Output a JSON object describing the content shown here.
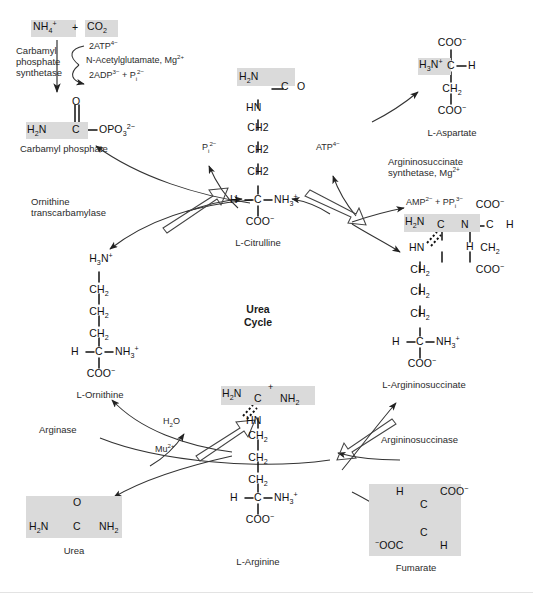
{
  "diagram": {
    "center_label_line1": "Urea",
    "center_label_line2": "Cycle"
  },
  "substrates": {
    "ammonia_co2": "NH4+ + CO2",
    "ammonia": "NH",
    "ammonia_sub": "4",
    "ammonia_sup": "+",
    "plus": "+",
    "co2": "CO",
    "co2_sub": "2"
  },
  "enzymes": [
    {
      "name": "carbamyl-phosphate-synthetase",
      "lines": [
        "Carbamyl",
        "phosphate",
        "synthetase"
      ]
    },
    {
      "name": "ornithine-transcarbamylase",
      "lines": [
        "Ornithine",
        "transcarbamylase"
      ]
    },
    {
      "name": "argininosuccinate-synthetase",
      "lines": [
        "Argininosuccinate",
        "synthetase, Mg2+"
      ]
    },
    {
      "name": "argininosuccinase",
      "lines": [
        "Argininosuccinase"
      ]
    },
    {
      "name": "arginase",
      "lines": [
        "Arginase"
      ]
    }
  ],
  "cofactors": {
    "atp2": "2ATP4-",
    "nag": "N-Acetylglutamate, Mg2+",
    "adp2": "2ADP3- + Pi2-",
    "pi": "Pi2-",
    "atp": "ATP4-",
    "amp_ppi": "AMP2- + PPi3-",
    "water": "H2O",
    "manganese": "Mu2+"
  },
  "metabolites": [
    {
      "id": "carbamyl-phosphate",
      "label": "Carbamyl phosphate"
    },
    {
      "id": "l-citrulline",
      "label": "L-Citrulline"
    },
    {
      "id": "l-aspartate",
      "label": "L-Aspartate"
    },
    {
      "id": "l-argininosuccinate",
      "label": "L-Argininosuccinate"
    },
    {
      "id": "l-arginine",
      "label": "L-Arginine"
    },
    {
      "id": "fumarate",
      "label": "Fumarate"
    },
    {
      "id": "l-ornithine",
      "label": "L-Ornithine"
    },
    {
      "id": "urea",
      "label": "Urea"
    }
  ],
  "structures": {
    "carbamyl_phosphate": {
      "name": "carbamyl-phosphate-structure",
      "o_top": "O",
      "left": "H2N",
      "center": "C",
      "right": "OPO3 2-"
    },
    "citrulline": {
      "name": "l-citrulline-structure",
      "h2n": "H2N",
      "co": "C=O",
      "hn": "HN",
      "ch2_a": "CH2",
      "ch2_b": "CH2",
      "ch2_c": "CH2",
      "h": "H",
      "c": "C",
      "nh3": "NH3+",
      "coo": "COO-"
    },
    "aspartate": {
      "name": "l-aspartate-structure",
      "coo_top": "COO-",
      "h3n": "H3N+",
      "c": "C",
      "h": "H",
      "ch2": "CH2",
      "coo_bottom": "COO-"
    },
    "argininosuccinate": {
      "name": "l-argininosuccinate-structure",
      "h2n": "H2N",
      "c": "C",
      "n": "N",
      "h_n": "H",
      "hn": "HN",
      "coo_top": "COO-",
      "c_side": "C",
      "h_side": "H",
      "ch2_side": "CH2",
      "coo_side": "COO-",
      "ch2_a": "CH2",
      "ch2_b": "CH2",
      "ch2_c": "CH2",
      "h": "H",
      "c_alpha": "C",
      "nh3": "NH3+",
      "coo": "COO-"
    },
    "arginine": {
      "name": "l-arginine-structure",
      "h2n": "H2N",
      "plus": "+",
      "c": "C",
      "nh2": "NH2",
      "hn": "HN",
      "ch2_a": "CH2",
      "ch2_b": "CH2",
      "ch2_c": "CH2",
      "h": "H",
      "c_alpha": "C",
      "nh3": "NH3+",
      "coo": "COO-"
    },
    "ornithine": {
      "name": "l-ornithine-structure",
      "h3n": "H3N+",
      "ch2_a": "CH2",
      "ch2_b": "CH2",
      "ch2_c": "CH2",
      "h": "H",
      "c_alpha": "C",
      "nh3": "NH3+",
      "coo": "COO-"
    },
    "urea": {
      "name": "urea-structure",
      "o": "O",
      "h2n": "H2N",
      "c": "C",
      "nh2": "NH2"
    },
    "fumarate": {
      "name": "fumarate-structure",
      "h_top": "H",
      "coo_top": "COO-",
      "c_top": "C",
      "c_bottom": "C",
      "coo_bottom": "-OOC",
      "h_bottom": "H"
    }
  },
  "colors": {
    "highlight": "#dadada",
    "ink": "#1a1a1a",
    "line": "#333333"
  }
}
